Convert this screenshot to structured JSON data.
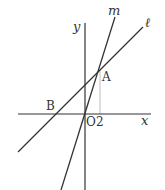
{
  "diagram": {
    "type": "coordinate-geometry",
    "axes": {
      "x_label": "x",
      "y_label": "y",
      "origin_label": "O"
    },
    "lines": [
      {
        "name": "ℓ",
        "passes_through": [
          "B",
          "A"
        ]
      },
      {
        "name": "m",
        "passes_through": [
          "O",
          "A"
        ]
      }
    ],
    "points": [
      {
        "label": "A",
        "description": "intersection of ℓ and m"
      },
      {
        "label": "B",
        "description": "x-intercept of ℓ"
      },
      {
        "label": "O",
        "description": "origin"
      }
    ],
    "tick_labels": {
      "x_tick": "2"
    },
    "colors": {
      "line": "#333333",
      "guide": "#bbbbbb",
      "background": "#ffffff"
    }
  }
}
